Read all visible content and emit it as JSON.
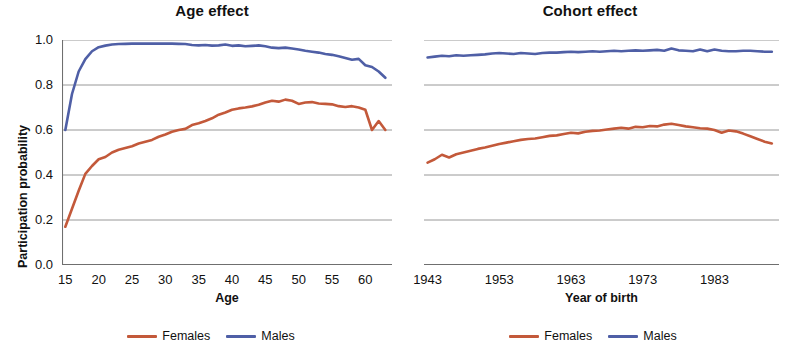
{
  "figure": {
    "legend_female_label": "Females",
    "legend_male_label": "Males",
    "color_female": "#c3593a",
    "color_male": "#4f5fa6",
    "grid_color": "#8d8d8d",
    "axis_color": "#6f6f6f"
  },
  "panels": {
    "age": {
      "title": "Age effect",
      "xlabel": "Age",
      "ylabel": "Participation probability",
      "yticks": [
        "1.0",
        "0.8",
        "0.6",
        "0.4",
        "0.2",
        "0.0"
      ],
      "xticks": [
        "15",
        "20",
        "25",
        "30",
        "35",
        "40",
        "45",
        "50",
        "55",
        "60"
      ]
    },
    "cohort": {
      "title": "Cohort effect",
      "xlabel": "Year of birth",
      "ylabel": "",
      "yticks": [
        "",
        "",
        "",
        "",
        "",
        ""
      ],
      "xticks": [
        "1943",
        "1953",
        "1963",
        "1973",
        "1983"
      ]
    }
  },
  "chart_data": [
    {
      "type": "line",
      "title": "Age effect",
      "xlabel": "Age",
      "ylabel": "Participation probability",
      "xlim": [
        14.5,
        64.0
      ],
      "ylim": [
        0.0,
        1.0
      ],
      "xticks": [
        15,
        20,
        25,
        30,
        35,
        40,
        45,
        50,
        55,
        60
      ],
      "yticks": [
        0.0,
        0.2,
        0.4,
        0.6,
        0.8,
        1.0
      ],
      "grid": "horizontal",
      "legend_position": "below",
      "x": [
        15,
        16,
        17,
        18,
        19,
        20,
        21,
        22,
        23,
        24,
        25,
        26,
        27,
        28,
        29,
        30,
        31,
        32,
        33,
        34,
        35,
        36,
        37,
        38,
        39,
        40,
        41,
        42,
        43,
        44,
        45,
        46,
        47,
        48,
        49,
        50,
        51,
        52,
        53,
        54,
        55,
        56,
        57,
        58,
        59,
        60,
        61,
        62,
        63
      ],
      "series": [
        {
          "name": "Females",
          "color": "#c3593a",
          "values": [
            0.17,
            0.25,
            0.33,
            0.405,
            0.44,
            0.47,
            0.48,
            0.5,
            0.512,
            0.52,
            0.528,
            0.54,
            0.548,
            0.556,
            0.57,
            0.58,
            0.592,
            0.6,
            0.605,
            0.622,
            0.63,
            0.64,
            0.652,
            0.668,
            0.678,
            0.69,
            0.696,
            0.7,
            0.705,
            0.712,
            0.722,
            0.73,
            0.726,
            0.735,
            0.73,
            0.716,
            0.722,
            0.724,
            0.718,
            0.716,
            0.714,
            0.706,
            0.702,
            0.706,
            0.7,
            0.69,
            0.6,
            0.64,
            0.6
          ]
        },
        {
          "name": "Males",
          "color": "#4f5fa6",
          "values": [
            0.6,
            0.76,
            0.86,
            0.915,
            0.95,
            0.968,
            0.975,
            0.98,
            0.982,
            0.983,
            0.984,
            0.984,
            0.984,
            0.984,
            0.984,
            0.984,
            0.984,
            0.983,
            0.982,
            0.978,
            0.976,
            0.978,
            0.975,
            0.976,
            0.98,
            0.974,
            0.976,
            0.972,
            0.974,
            0.976,
            0.972,
            0.966,
            0.964,
            0.966,
            0.962,
            0.958,
            0.952,
            0.948,
            0.944,
            0.938,
            0.934,
            0.928,
            0.92,
            0.912,
            0.916,
            0.888,
            0.88,
            0.86,
            0.832
          ]
        }
      ]
    },
    {
      "type": "line",
      "title": "Cohort effect",
      "xlabel": "Year of birth",
      "ylabel": "",
      "xlim": [
        1942.5,
        1992.0
      ],
      "ylim": [
        0.0,
        1.0
      ],
      "xticks": [
        1943,
        1953,
        1963,
        1973,
        1983
      ],
      "yticks": [
        0.0,
        0.2,
        0.4,
        0.6,
        0.8,
        1.0
      ],
      "grid": "horizontal",
      "legend_position": "below",
      "x": [
        1943,
        1944,
        1945,
        1946,
        1947,
        1948,
        1949,
        1950,
        1951,
        1952,
        1953,
        1954,
        1955,
        1956,
        1957,
        1958,
        1959,
        1960,
        1961,
        1962,
        1963,
        1964,
        1965,
        1966,
        1967,
        1968,
        1969,
        1970,
        1971,
        1972,
        1973,
        1974,
        1975,
        1976,
        1977,
        1978,
        1979,
        1980,
        1981,
        1982,
        1983,
        1984,
        1985,
        1986,
        1987,
        1988,
        1989,
        1990,
        1991
      ],
      "series": [
        {
          "name": "Females",
          "color": "#c3593a",
          "values": [
            0.455,
            0.47,
            0.49,
            0.478,
            0.492,
            0.5,
            0.508,
            0.516,
            0.522,
            0.53,
            0.538,
            0.544,
            0.55,
            0.556,
            0.56,
            0.562,
            0.568,
            0.574,
            0.576,
            0.582,
            0.588,
            0.585,
            0.592,
            0.596,
            0.598,
            0.602,
            0.606,
            0.61,
            0.606,
            0.614,
            0.612,
            0.618,
            0.616,
            0.624,
            0.628,
            0.622,
            0.616,
            0.612,
            0.608,
            0.606,
            0.6,
            0.588,
            0.598,
            0.594,
            0.584,
            0.572,
            0.56,
            0.548,
            0.54
          ]
        },
        {
          "name": "Males",
          "color": "#4f5fa6",
          "values": [
            0.922,
            0.926,
            0.93,
            0.928,
            0.932,
            0.93,
            0.932,
            0.934,
            0.936,
            0.94,
            0.942,
            0.94,
            0.938,
            0.942,
            0.94,
            0.938,
            0.942,
            0.944,
            0.944,
            0.946,
            0.948,
            0.946,
            0.948,
            0.95,
            0.948,
            0.95,
            0.952,
            0.95,
            0.952,
            0.954,
            0.952,
            0.954,
            0.956,
            0.952,
            0.962,
            0.954,
            0.952,
            0.95,
            0.958,
            0.95,
            0.958,
            0.952,
            0.95,
            0.95,
            0.952,
            0.952,
            0.95,
            0.948,
            0.948
          ]
        }
      ]
    }
  ]
}
